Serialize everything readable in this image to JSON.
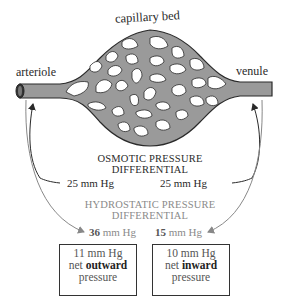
{
  "diagram": {
    "labels": {
      "capillary_bed": "capillary bed",
      "arteriole": "arteriole",
      "venule": "venule"
    },
    "osmotic": {
      "title_line1": "OSMOTIC PRESSURE",
      "title_line2": "DIFFERENTIAL",
      "left_value": "25 mm Hg",
      "right_value": "25 mm Hg"
    },
    "hydrostatic": {
      "title_line1": "HYDROSTATIC PRESSURE",
      "title_line2": "DIFFERENTIAL",
      "left_number": "36",
      "left_unit": " mm Hg",
      "right_number": "15",
      "right_unit": " mm Hg"
    },
    "net_boxes": [
      {
        "value": "11 mm Hg",
        "prefix": "net ",
        "direction": "outward",
        "suffix": "pressure"
      },
      {
        "value": "10 mm Hg",
        "prefix": "net ",
        "direction": "inward",
        "suffix": "pressure"
      }
    ],
    "colors": {
      "vessel_fill": "#9a9a9a",
      "vessel_stroke": "#2a2a2a",
      "osmotic_text": "#2a2a2a",
      "hydrostatic_text": "#8a8a8a"
    }
  }
}
